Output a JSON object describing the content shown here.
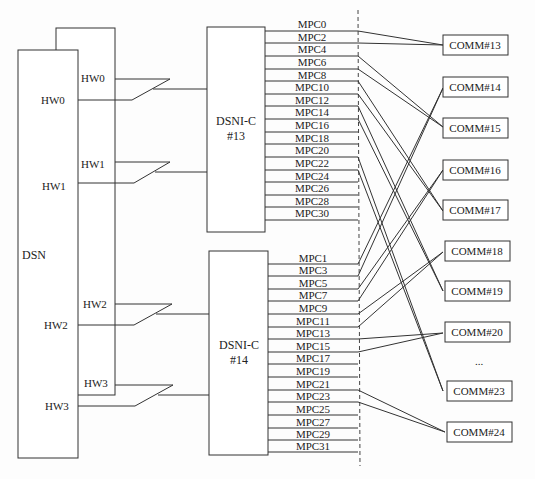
{
  "diagram": {
    "dsn": {
      "label": "DSN"
    },
    "dsn_back_ports": [
      "HW0",
      "HW1",
      "HW2",
      "HW3"
    ],
    "dsn_front_ports": [
      "HW0",
      "HW1",
      "HW2",
      "HW3"
    ],
    "dsni_modules": [
      {
        "label_line1": "DSNI-C",
        "label_line2": "#13"
      },
      {
        "label_line1": "DSNI-C",
        "label_line2": "#14"
      }
    ],
    "mpc_even": [
      "MPC0",
      "MPC2",
      "MPC4",
      "MPC6",
      "MPC8",
      "MPC10",
      "MPC12",
      "MPC14",
      "MPC16",
      "MPC18",
      "MPC20",
      "MPC22",
      "MPC24",
      "MPC26",
      "MPC28",
      "MPC30"
    ],
    "mpc_odd": [
      "MPC1",
      "MPC3",
      "MPC5",
      "MPC7",
      "MPC9",
      "MPC11",
      "MPC13",
      "MPC15",
      "MPC17",
      "MPC19",
      "MPC21",
      "MPC23",
      "MPC25",
      "MPC27",
      "MPC29",
      "MPC31"
    ],
    "comm_boxes": [
      "COMM#13",
      "COMM#14",
      "COMM#15",
      "COMM#16",
      "COMM#17",
      "COMM#18",
      "COMM#19",
      "COMM#20",
      "COMM#23",
      "COMM#24"
    ],
    "ellipsis": "...",
    "connections": [
      {
        "from": [
          "MPC0",
          "MPC2"
        ],
        "to": "COMM#13"
      },
      {
        "from": [
          "MPC4",
          "MPC6"
        ],
        "to": "COMM#15"
      },
      {
        "from": [
          "MPC8",
          "MPC10"
        ],
        "to": "COMM#17"
      },
      {
        "from": [
          "MPC12",
          "MPC14"
        ],
        "to": "COMM#19"
      },
      {
        "from": [
          "MPC20",
          "MPC22"
        ],
        "to": "COMM#23"
      },
      {
        "from": [
          "MPC1",
          "MPC3"
        ],
        "to": "COMM#14"
      },
      {
        "from": [
          "MPC5",
          "MPC7"
        ],
        "to": "COMM#16"
      },
      {
        "from": [
          "MPC9",
          "MPC11"
        ],
        "to": "COMM#18"
      },
      {
        "from": [
          "MPC13",
          "MPC15"
        ],
        "to": "COMM#20"
      },
      {
        "from": [
          "MPC23",
          "MPC25"
        ],
        "to": "COMM#24"
      }
    ]
  }
}
